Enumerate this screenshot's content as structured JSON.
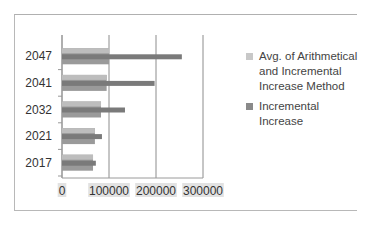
{
  "chart_data": {
    "type": "bar",
    "orientation": "horizontal",
    "title": "",
    "xlabel": "",
    "ylabel": "",
    "categories": [
      "2017",
      "2021",
      "2032",
      "2041",
      "2047"
    ],
    "series": [
      {
        "name": "Avg. of Arithmetical and Incremental Increase Method",
        "color": "#9a9a9a",
        "values": [
          66000,
          70000,
          83000,
          95000,
          100000
        ]
      },
      {
        "name": "Incremental Increase",
        "color": "#7a7a7a",
        "values": [
          72000,
          85000,
          134000,
          197000,
          255000
        ]
      }
    ],
    "xlim": [
      0,
      300000
    ],
    "xticks": [
      "0",
      "100000",
      "200000",
      "300000"
    ],
    "grid": true,
    "legend_position": "right"
  }
}
